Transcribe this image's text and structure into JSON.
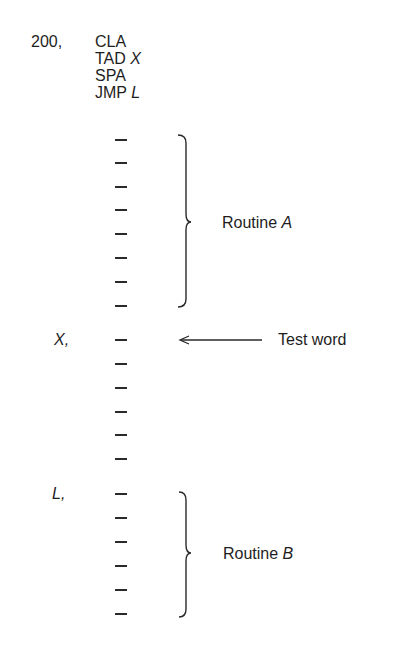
{
  "program": {
    "origin_label": "200,",
    "instructions": [
      {
        "op": "CLA",
        "arg": ""
      },
      {
        "op": "TAD",
        "arg": "X"
      },
      {
        "op": "SPA",
        "arg": ""
      },
      {
        "op": "JMP",
        "arg": "L"
      }
    ]
  },
  "routine_a": {
    "label_prefix": "Routine",
    "label_name": "A",
    "word_count": 8
  },
  "test_word": {
    "address_label": "X,",
    "annotation": "Test word",
    "arrow": "left-arrow"
  },
  "between_words_count": 6,
  "routine_b": {
    "address_label": "L,",
    "label_prefix": "Routine",
    "label_name": "B",
    "word_count": 6
  }
}
